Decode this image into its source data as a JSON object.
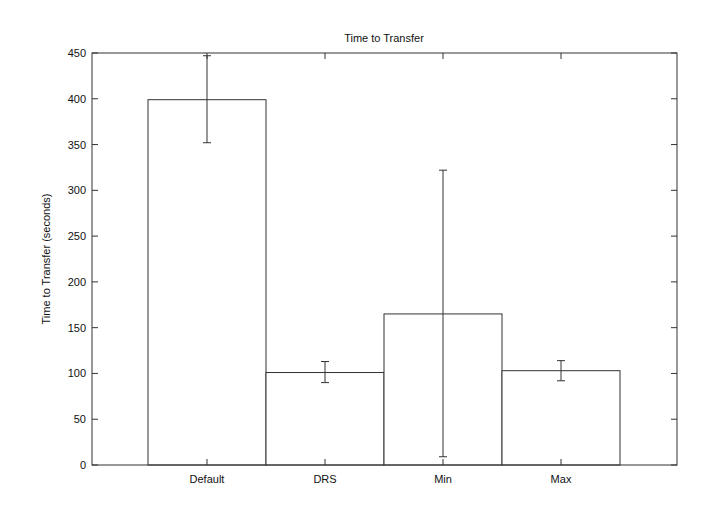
{
  "chart_data": {
    "type": "bar",
    "title": "Time to Transfer",
    "xlabel": "",
    "ylabel": "Time to Transfer (seconds)",
    "ylim": [
      0,
      450
    ],
    "yticks": [
      0,
      50,
      100,
      150,
      200,
      250,
      300,
      350,
      400,
      450
    ],
    "categories": [
      "Default",
      "DRS",
      "Min",
      "Max"
    ],
    "values": [
      399,
      101,
      165,
      103
    ],
    "error_low": [
      352,
      90,
      9,
      92
    ],
    "error_high": [
      447,
      113,
      322,
      114
    ],
    "grid": false,
    "legend": null
  },
  "colors": {
    "axis": "#333333",
    "bar_stroke": "#333333",
    "bar_fill": "#ffffff"
  }
}
